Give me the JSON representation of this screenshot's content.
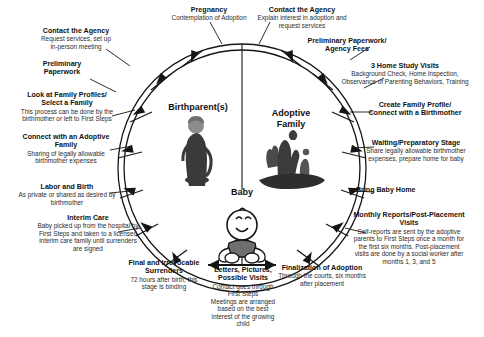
{
  "diagram": {
    "type": "cycle-diagram",
    "center": {
      "birthparent_label": "Birthparent(s)",
      "adoptive_label_line1": "Adoptive",
      "adoptive_label_line2": "Family",
      "baby_label": "Baby",
      "birthparent_icon": "pregnant-woman-icon",
      "adoptive_family_icon": "family-group-icon",
      "baby_icon": "baby-sitting-icon",
      "divider_icon": "vertical-divider-line"
    },
    "left_branch": {
      "name": "Birthparent path",
      "steps": [
        {
          "title": "Pregnancy",
          "detail": "Contemplation of Adoption"
        },
        {
          "title": "Contact the Agency",
          "detail": "Request services, set up\nin-person meeting"
        },
        {
          "title": "Preliminary\nPaperwork",
          "detail": ""
        },
        {
          "title": "Look at Family Profiles/\nSelect a Family",
          "detail": "This process can be done by the\nbirthmother or left to First Steps"
        },
        {
          "title": "Connect with an Adoptive\nFamily",
          "detail": "Sharing of legally allowable\nbirthmother expenses"
        },
        {
          "title": "Labor and Birth",
          "detail": "As private or shared as desired by\nbirthmother"
        },
        {
          "title": "Interim Care",
          "detail": "Baby picked up from the hospital by\nFirst Steps and taken to a licensed\ninterim care family until surrenders\nare signed"
        },
        {
          "title": "Final and Irrevocable\nSurrenders",
          "detail": "72 hours after birth, this\nstage is binding"
        }
      ]
    },
    "right_branch": {
      "name": "Adoptive family path",
      "steps": [
        {
          "title": "Contact the Agency",
          "detail": "Explain interest in adoption and\nrequest services"
        },
        {
          "title": "Preliminary Paperwork/\nAgency Fees",
          "detail": ""
        },
        {
          "title": "3 Home Study Visits",
          "detail": "Background Check, Home Inspection,\nObservance of Parenting Behaviors, Training"
        },
        {
          "title": "Create Family Profile/\nConnect with a Birthmother",
          "detail": ""
        },
        {
          "title": "Waiting/Preparatory Stage",
          "detail": "Share legally allowable birthmother\nexpenses, prepare home for baby"
        },
        {
          "title": "Bring Baby Home",
          "detail": ""
        },
        {
          "title": "Monthly Reports/Post-Placement\nVisits",
          "detail": "Self-reports are sent by the adoptive\nparents to First Steps once a month for\nthe first six months. Post-placement\nvisits are done by a social worker after\nmonths 1, 3, and 5"
        },
        {
          "title": "Finalization of Adoption",
          "detail": "Through the courts, six months\nafter placement"
        }
      ]
    },
    "bottom": {
      "title": "Letters, Pictures,\nPossible Visits",
      "detail": "Contact goes through\nFirst Steps\nMeetings are arranged\nbased on the best\ninterest of the growing\nchild"
    },
    "colors": {
      "line": "#151515",
      "text": "#111111",
      "detail_text": "#2b2b2b",
      "background": "#ffffff"
    }
  }
}
